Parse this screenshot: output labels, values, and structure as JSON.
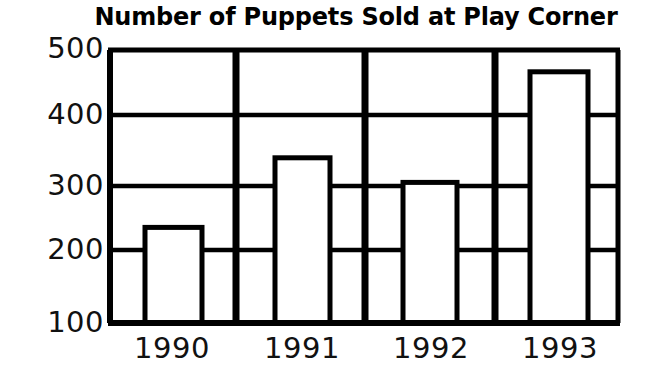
{
  "chart_data": {
    "type": "bar",
    "title": "Number of Puppets Sold at Play Corner",
    "xlabel": "",
    "ylabel": "",
    "categories": [
      "1990",
      "1991",
      "1992",
      "1993"
    ],
    "values": [
      240,
      342,
      306,
      468
    ],
    "series": [
      {
        "name": "Puppets Sold",
        "values": [
          240,
          342,
          306,
          468
        ]
      }
    ],
    "ylim": [
      100,
      500
    ],
    "y_ticks": [
      100,
      200,
      300,
      400,
      500
    ],
    "y_tick_labels": [
      "100",
      "200",
      "300",
      "400",
      "500"
    ],
    "x_tick_labels": [
      "1990",
      "1991",
      "1992",
      "1993"
    ],
    "grid": "horizontal",
    "legend": "none",
    "bar_fill_color": "#ffffff",
    "bar_edge_color": "#000000",
    "axis_color": "#000000",
    "background_color": "#ffffff"
  },
  "axes": {
    "y_labels": [
      "500",
      "400",
      "300",
      "200",
      "100"
    ],
    "x_labels": [
      "1990",
      "1991",
      "1992",
      "1993"
    ]
  }
}
